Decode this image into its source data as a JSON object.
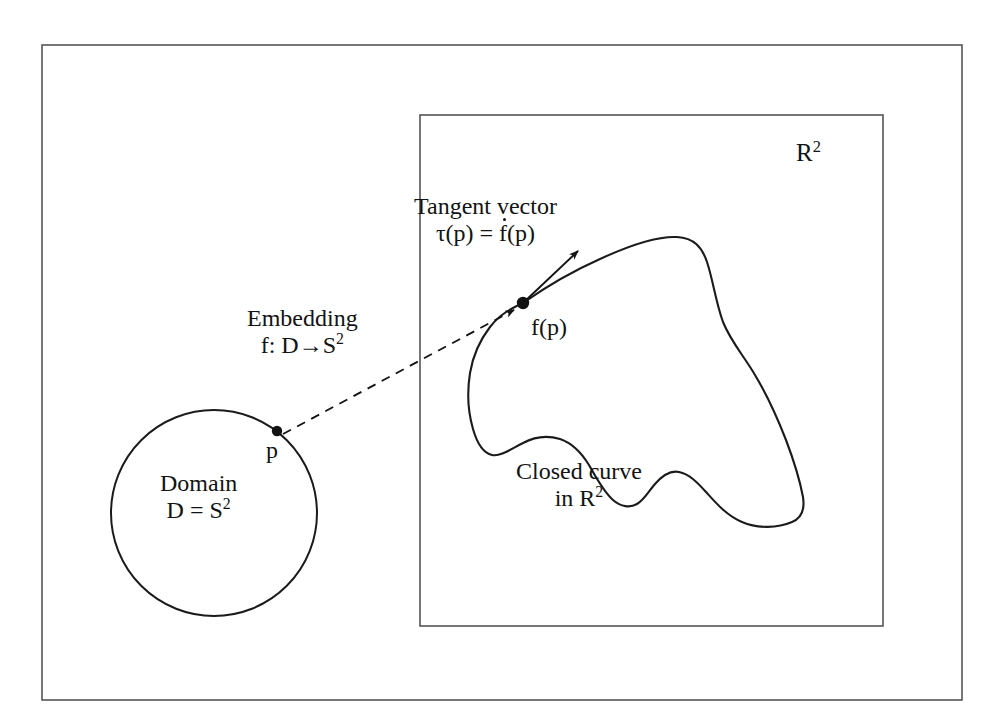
{
  "figure": {
    "outer_frame": {
      "x": 42,
      "y": 45,
      "width": 920,
      "height": 655
    },
    "inner_frame": {
      "x": 420,
      "y": 115,
      "width": 463,
      "height": 511
    },
    "stroke_color": "#4a4a4a",
    "curve_color": "#1b1b1b"
  },
  "labels": {
    "r2_space": {
      "base": "R",
      "sup": "2"
    },
    "tangent_vector_title": "Tangent vector",
    "tangent_vector_formula_prefix": "τ(p) = ",
    "tangent_vector_formula_dotted": "f",
    "tangent_vector_formula_suffix": "(p)",
    "image_point": "f(p)",
    "embedding_title": "Embedding",
    "embedding_formula_prefix": "f: D→S",
    "embedding_formula_sup": "2",
    "domain_point": "p",
    "domain_title": "Domain",
    "domain_formula_prefix": "D = S",
    "domain_formula_sup": "2",
    "closed_curve_line1": "Closed curve",
    "closed_curve_line2_prefix": "in R",
    "closed_curve_line2_sup": "2"
  },
  "geometry": {
    "domain_circle": {
      "cx": 214,
      "cy": 513,
      "r": 103
    },
    "domain_point_dot": {
      "cx": 277,
      "cy": 431,
      "r": 5
    },
    "image_point_dot": {
      "cx": 523,
      "cy": 303,
      "r": 6
    },
    "embedding_arrow": {
      "x1": 283,
      "y1": 434,
      "x2": 517,
      "y2": 308
    },
    "tangent_arrow": {
      "x1": 523,
      "y1": 303,
      "x2": 580,
      "y2": 250
    }
  }
}
